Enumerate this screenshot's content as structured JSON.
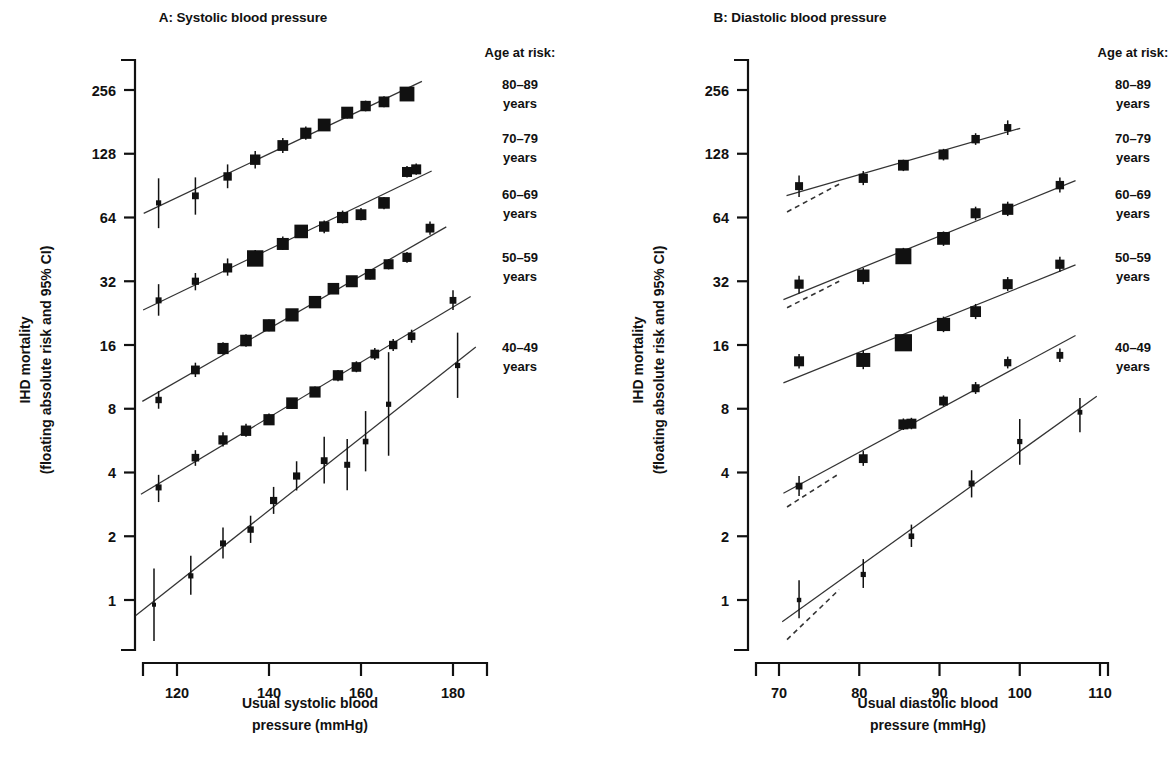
{
  "figure": {
    "panels": [
      {
        "id": "A",
        "title": "A: Systolic blood pressure",
        "xlabel_line1": "Usual systolic blood",
        "xlabel_line2": "pressure (mmHg)"
      },
      {
        "id": "B",
        "title": "B: Diastolic blood pressure",
        "xlabel_line1": "Usual diastolic blood",
        "xlabel_line2": "pressure (mmHg)"
      }
    ],
    "ylabel_line1": "IHD mortality",
    "ylabel_line2": "(floating absolute risk and 95% CI)",
    "legend": {
      "heading": "Age at risk:",
      "items": [
        {
          "label_line1": "80–89",
          "label_line2": "years"
        },
        {
          "label_line1": "70–79",
          "label_line2": "years"
        },
        {
          "label_line1": "60–69",
          "label_line2": "years"
        },
        {
          "label_line1": "50–59",
          "label_line2": "years"
        },
        {
          "label_line1": "40–49",
          "label_line2": "years"
        }
      ]
    }
  },
  "chart_data": [
    {
      "type": "scatter",
      "panel": "A",
      "title": "A: Systolic blood pressure",
      "xlabel": "Usual systolic blood pressure (mmHg)",
      "ylabel": "IHD mortality (floating absolute risk and 95% CI)",
      "yscale": "log2",
      "ylim": [
        0.55,
        400
      ],
      "yticks": [
        1,
        2,
        4,
        8,
        16,
        32,
        64,
        128,
        256
      ],
      "ytick_labels": [
        "1",
        "2",
        "4",
        "8",
        "16",
        "32",
        "64",
        "128",
        "256"
      ],
      "xlim": [
        112,
        186
      ],
      "xticks": [
        120,
        140,
        160,
        180
      ],
      "xtick_labels": [
        "120",
        "140",
        "160",
        "180"
      ],
      "grid": false,
      "legend_position": "right",
      "series": [
        {
          "name": "80–89 years",
          "x": [
            116,
            124,
            131,
            137,
            143,
            148,
            152,
            157,
            161,
            165,
            170
          ],
          "y": [
            75,
            81,
            100,
            120,
            140,
            160,
            175,
            200,
            215,
            225,
            245
          ],
          "ci_low": [
            57,
            66,
            88,
            109,
            129,
            149,
            164,
            188,
            203,
            212,
            231
          ],
          "ci_high": [
            98,
            99,
            114,
            132,
            152,
            172,
            187,
            213,
            228,
            239,
            260
          ],
          "marker_size": [
            2.6,
            3.4,
            4.2,
            5.2,
            5.4,
            5.6,
            6.4,
            6.0,
            5.2,
            5.4,
            7.4
          ]
        },
        {
          "name": "70–79 years",
          "x": [
            116,
            124,
            131,
            137,
            143,
            147,
            152,
            156,
            160,
            165,
            170,
            172
          ],
          "y": [
            26,
            32,
            37,
            41,
            48,
            55,
            58,
            64,
            66,
            75,
            105,
            108
          ],
          "ci_low": [
            22,
            29,
            34,
            38,
            45,
            52,
            54,
            60,
            62,
            70,
            99,
            102
          ],
          "ci_high": [
            31,
            35,
            41,
            45,
            52,
            59,
            62,
            69,
            71,
            80,
            112,
            115
          ],
          "marker_size": [
            3.0,
            3.6,
            4.6,
            8.2,
            6.0,
            6.8,
            5.2,
            5.6,
            5.4,
            5.8,
            5.0,
            5.0
          ]
        },
        {
          "name": "60–69 years",
          "x": [
            116,
            124,
            130,
            135,
            140,
            145,
            150,
            154,
            158,
            162,
            166,
            170,
            175
          ],
          "y": [
            8.8,
            12.2,
            15.4,
            16.8,
            19.8,
            22.2,
            25.5,
            29.5,
            32.0,
            34.5,
            38.5,
            41.5,
            57.0
          ],
          "ci_low": [
            8.0,
            11.3,
            14.4,
            15.7,
            18.6,
            21.0,
            24.1,
            28.0,
            30.3,
            32.6,
            36.4,
            39.1,
            53.0
          ],
          "ci_high": [
            9.7,
            13.2,
            16.5,
            18.0,
            21.1,
            23.5,
            27.0,
            31.1,
            33.8,
            36.5,
            40.7,
            44.0,
            61.3
          ],
          "marker_size": [
            3.2,
            4.4,
            5.6,
            5.8,
            6.2,
            6.6,
            6.2,
            5.8,
            6.0,
            5.4,
            5.0,
            4.6,
            4.4
          ]
        },
        {
          "name": "50–59 years",
          "x": [
            116,
            124,
            130,
            135,
            140,
            145,
            150,
            155,
            159,
            163,
            167,
            171,
            180
          ],
          "y": [
            3.4,
            4.7,
            5.7,
            6.3,
            7.1,
            8.5,
            9.6,
            11.5,
            12.6,
            14.5,
            16.0,
            17.6,
            26.0
          ],
          "ci_low": [
            2.9,
            4.3,
            5.3,
            5.9,
            6.7,
            8.0,
            9.1,
            10.8,
            11.9,
            13.6,
            15.0,
            16.4,
            23.4
          ],
          "ci_high": [
            3.9,
            5.1,
            6.2,
            6.8,
            7.6,
            9.0,
            10.2,
            12.2,
            13.4,
            15.5,
            17.1,
            18.9,
            29.0
          ],
          "marker_size": [
            3.0,
            3.8,
            4.6,
            5.2,
            5.6,
            5.8,
            5.6,
            5.2,
            4.8,
            4.4,
            4.2,
            3.8,
            3.4
          ]
        },
        {
          "name": "40–49 years",
          "x": [
            115,
            123,
            130,
            136,
            141,
            146,
            152,
            157,
            161,
            166,
            181
          ],
          "y": [
            0.95,
            1.3,
            1.85,
            2.15,
            2.95,
            3.85,
            4.55,
            4.35,
            5.6,
            8.4,
            12.8
          ],
          "ci_low": [
            0.64,
            1.06,
            1.57,
            1.86,
            2.55,
            3.29,
            3.55,
            3.3,
            4.05,
            4.8,
            9.0
          ],
          "ci_high": [
            1.41,
            1.62,
            2.2,
            2.5,
            3.42,
            4.52,
            5.9,
            5.75,
            7.8,
            14.8,
            18.3
          ],
          "marker_size": [
            2.0,
            2.6,
            3.0,
            3.2,
            3.6,
            3.6,
            3.4,
            3.0,
            2.8,
            2.6,
            2.6
          ]
        }
      ]
    },
    {
      "type": "scatter",
      "panel": "B",
      "title": "B: Diastolic blood pressure",
      "xlabel": "Usual diastolic blood pressure (mmHg)",
      "ylabel": "IHD mortality (floating absolute risk and 95% CI)",
      "yscale": "log2",
      "ylim": [
        0.55,
        400
      ],
      "yticks": [
        1,
        2,
        4,
        8,
        16,
        32,
        64,
        128,
        256
      ],
      "ytick_labels": [
        "1",
        "2",
        "4",
        "8",
        "16",
        "32",
        "64",
        "128",
        "256"
      ],
      "xlim": [
        66,
        115
      ],
      "xticks": [
        70,
        80,
        90,
        100,
        110
      ],
      "xtick_labels": [
        "70",
        "80",
        "90",
        "100",
        "110"
      ],
      "grid": false,
      "legend_position": "right",
      "series": [
        {
          "name": "80–89 years",
          "x": [
            72.5,
            80.5,
            85.5,
            90.5,
            94.5,
            98.5
          ],
          "y": [
            90,
            98,
            113,
            127,
            150,
            170
          ],
          "ci_low": [
            80,
            91,
            106,
            119,
            141,
            157
          ],
          "ci_high": [
            101,
            106,
            120,
            135,
            160,
            184
          ],
          "marker_size": [
            4.0,
            4.6,
            5.4,
            5.0,
            4.2,
            3.6
          ],
          "extrapolation": {
            "x0": 71.0,
            "y0": 68,
            "x1": 77.5,
            "y1": 92
          }
        },
        {
          "name": "70–79 years",
          "x": [
            72.5,
            80.5,
            85.5,
            90.5,
            94.5,
            98.5,
            105.0
          ],
          "y": [
            31,
            34,
            42,
            51,
            67,
            70,
            91
          ],
          "ci_low": [
            28,
            31,
            39,
            47,
            62,
            65,
            84
          ],
          "ci_high": [
            34,
            37,
            46,
            55,
            72,
            76,
            99
          ],
          "marker_size": [
            4.6,
            6.2,
            8.0,
            6.4,
            5.0,
            5.6,
            4.2
          ],
          "extrapolation": {
            "x0": 71.0,
            "y0": 24,
            "x1": 77.5,
            "y1": 32
          }
        },
        {
          "name": "60–69 years",
          "x": [
            72.5,
            80.5,
            85.5,
            90.5,
            94.5,
            98.5,
            105.0
          ],
          "y": [
            13.4,
            13.6,
            16.4,
            20.0,
            23.0,
            31.0,
            38.5
          ],
          "ci_low": [
            12.4,
            12.3,
            15.0,
            18.4,
            21.2,
            28.8,
            35.5
          ],
          "ci_high": [
            14.5,
            15.1,
            18.0,
            21.8,
            25.0,
            33.5,
            41.8
          ],
          "marker_size": [
            5.0,
            7.0,
            8.6,
            6.6,
            5.4,
            5.0,
            4.6
          ],
          "extrapolation": null
        },
        {
          "name": "50–59 years",
          "x": [
            72.5,
            80.5,
            85.5,
            86.5,
            90.5,
            94.5,
            98.5,
            105.0
          ],
          "y": [
            3.45,
            4.65,
            6.75,
            6.8,
            8.7,
            10.0,
            13.2,
            14.3
          ],
          "ci_low": [
            3.1,
            4.3,
            6.35,
            6.4,
            8.2,
            9.4,
            12.4,
            13.3
          ],
          "ci_high": [
            3.85,
            5.05,
            7.2,
            7.25,
            9.25,
            10.7,
            14.1,
            15.4
          ],
          "marker_size": [
            3.4,
            4.4,
            5.0,
            5.0,
            4.4,
            4.0,
            3.6,
            3.4
          ],
          "extrapolation": {
            "x0": 71.0,
            "y0": 2.75,
            "x1": 77.5,
            "y1": 3.95
          }
        },
        {
          "name": "40–49 years",
          "x": [
            72.5,
            80.5,
            86.5,
            94.0,
            100.0,
            107.5
          ],
          "y": [
            1.0,
            1.32,
            2.0,
            3.55,
            5.6,
            7.7
          ],
          "ci_low": [
            0.82,
            1.14,
            1.78,
            3.05,
            4.35,
            6.2
          ],
          "ci_high": [
            1.24,
            1.56,
            2.27,
            4.1,
            7.15,
            9.0
          ],
          "marker_size": [
            2.2,
            2.6,
            2.8,
            3.0,
            2.6,
            2.4
          ],
          "extrapolation": {
            "x0": 71.0,
            "y0": 0.65,
            "x1": 77.5,
            "y1": 1.12
          }
        }
      ]
    }
  ]
}
